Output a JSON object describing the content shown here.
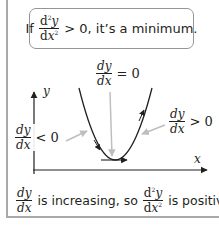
{
  "rule_box": {
    "prefix": "If",
    "fraction": {
      "numerator_d": "d",
      "numerator_sup": "2",
      "numerator_var": "y",
      "denominator_d": "d",
      "denominator_var": "x",
      "denominator_sup": "2"
    },
    "suffix": "> 0, it’s a minimum."
  },
  "labels": {
    "top": {
      "num": "dy",
      "den": "dx",
      "relation": "= 0"
    },
    "left": {
      "num": "dy",
      "den": "dx",
      "relation": "< 0"
    },
    "right": {
      "num": "dy",
      "den": "dx",
      "relation": "> 0"
    }
  },
  "axes": {
    "x_label": "x",
    "y_label": "y"
  },
  "caption": {
    "frac1": {
      "num": "dy",
      "den": "dx"
    },
    "middle_text": "is increasing, so",
    "frac2": {
      "num_d": "d",
      "num_sup": "2",
      "num_var": "y",
      "den_d": "d",
      "den_var": "x",
      "den_sup": "2"
    },
    "end_text": "is positive"
  },
  "colors": {
    "border": "#a7a9ac",
    "pointer": "#bcbec0",
    "ink": "#231f20"
  }
}
